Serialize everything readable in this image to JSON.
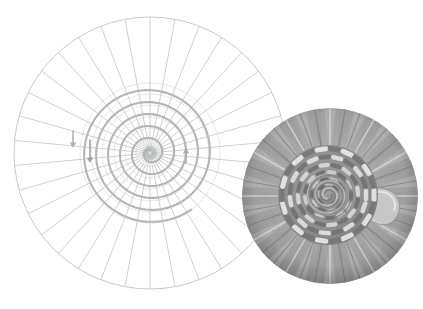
{
  "figure": {
    "background_color": "#ffffff",
    "width": 423,
    "height": 309,
    "caption_text": ""
  },
  "diagram": {
    "name": "spoke-and-spiral-weaving-diagram",
    "center_x": 150,
    "center_y": 153,
    "outer_radius": 136,
    "spoke_count": 34,
    "spoke_color": "#b9bcbe",
    "spoke_width": 0.7,
    "rim_color": "#b9bcbe",
    "rim_width": 0.8,
    "hub_radius": 7,
    "hub_color": "#b0b3b5",
    "spiral": {
      "name": "weaver-spiral-path",
      "color": "#b3b6b8",
      "stroke_width": 2.1,
      "turns": 5.6,
      "start_radius": 3,
      "end_radius": 70,
      "direction": "counter-clockwise-outward"
    },
    "concentric_guides": {
      "color": "#c8cbcd",
      "radii": [
        14,
        25,
        36,
        48,
        59,
        70
      ]
    },
    "arrows": [
      {
        "name": "direction-arrow-outer",
        "label": "",
        "x": 73,
        "y_start": 131,
        "y_end": 148,
        "direction": "down",
        "color": "#b0b3b5"
      },
      {
        "name": "direction-arrow-mid",
        "label": "",
        "x": 90,
        "y_start": 140,
        "y_end": 163,
        "direction": "down",
        "color": "#9ea1a3"
      },
      {
        "name": "direction-arrow-center",
        "label": "",
        "x": 186,
        "y_start": 163,
        "y_end": 148,
        "direction": "up",
        "color": "#a8abad"
      }
    ]
  },
  "photo": {
    "name": "woven-basket-base-photo",
    "alt_text": "Grayscale close-up photograph of a woven basket base showing radiating spokes and a coiled central weave",
    "center_x": 330,
    "center_y": 196,
    "radius": 88,
    "spoke_count": 36,
    "palette": {
      "field_light": "#d8d8d8",
      "field_mid": "#a9a9a9",
      "field_dark": "#767676",
      "weave_highlight": "#efefef",
      "weave_mid": "#9a9a9a",
      "weave_dark": "#5e5e5e",
      "core": "#8a8a8a"
    },
    "core_radius": 50,
    "tail_label": ""
  },
  "legend": {
    "items": []
  }
}
